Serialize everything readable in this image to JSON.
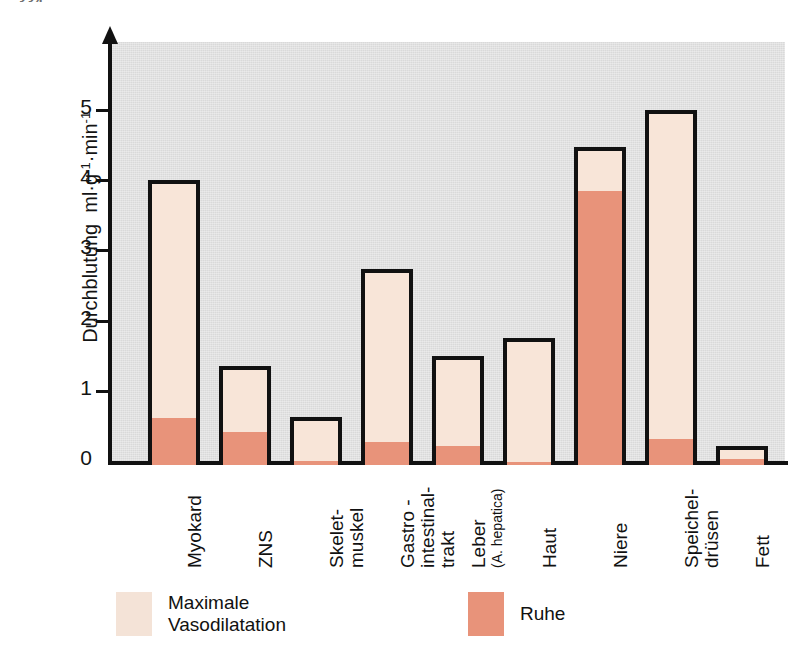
{
  "page_number": "334",
  "chart_data": {
    "type": "bar",
    "title": "",
    "xlabel": "",
    "ylabel": "Durchblutung  ml·g⁻¹·min⁻¹",
    "ylabel_main": "Durchblutung",
    "ylabel_unit_base": "ml·g",
    "ylabel_unit_exp1": "-1",
    "ylabel_unit_mid": "·min",
    "ylabel_unit_exp2": "-1",
    "ylim": [
      0,
      5.7
    ],
    "yticks": [
      0,
      1,
      2,
      3,
      4,
      5
    ],
    "ytick_labels": [
      "0",
      "1",
      "2",
      "3",
      "4",
      "5"
    ],
    "grid": false,
    "legend_position": "bottom-left",
    "categories": [
      "Myokard",
      "ZNS",
      "Skelet-\nmuskel",
      "Gastro -\nintestinal-\ntrakt",
      "Leber",
      "Haut",
      "Niere",
      "Speichel-\ndrüsen",
      "Fett"
    ],
    "category_sublabels": {
      "Leber": "(A. hepatica)"
    },
    "series": [
      {
        "name": "Maximale Vasodilatation",
        "color": "#f8e5d8",
        "values": [
          4.0,
          1.35,
          0.63,
          2.73,
          1.5,
          1.75,
          4.48,
          5.0,
          0.22
        ]
      },
      {
        "name": "Ruhe",
        "color": "#e8937a",
        "values": [
          0.7,
          0.5,
          0.08,
          0.35,
          0.3,
          0.07,
          3.93,
          0.4,
          0.12
        ]
      }
    ]
  },
  "legend": {
    "items": [
      {
        "label": "Maximale\nVasodilatation",
        "swatch_class": "vaso"
      },
      {
        "label": "Ruhe",
        "swatch_class": "ruhe"
      }
    ]
  },
  "colors": {
    "plot_background": "#d9d9d9",
    "page_background": "#ffffff",
    "axis": "#111111",
    "vasodilatation_fill": "#f8e5d8",
    "ruhe_fill": "#e8937a"
  }
}
